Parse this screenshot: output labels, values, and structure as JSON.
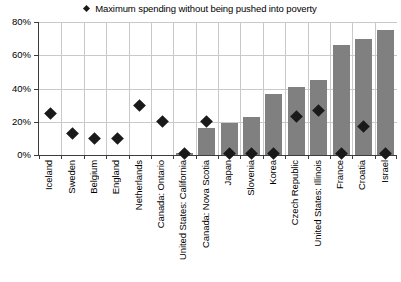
{
  "chart_data": {
    "type": "bar",
    "title": "",
    "xlabel": "",
    "ylabel": "",
    "ylim": [
      0,
      80
    ],
    "y_ticks": [
      "0%",
      "20%",
      "40%",
      "60%",
      "80%"
    ],
    "y_tick_values": [
      0,
      20,
      40,
      60,
      80
    ],
    "grid": true,
    "legend_position": "top-center",
    "legend": [
      {
        "name": "Maximum spending without being pushed into poverty",
        "marker": "diamond",
        "color": "#1a1a1a"
      }
    ],
    "categories": [
      "Iceland",
      "Sweden",
      "Belgium",
      "England",
      "Netherlands",
      "Canada: Ontario",
      "United States: California",
      "Canada: Nova Scotia",
      "Japan",
      "Slovenia",
      "Korea",
      "Czech Republic",
      "United States: Illinois",
      "France",
      "Croatia",
      "Israel"
    ],
    "series": [
      {
        "name": "Bar series",
        "type": "bar",
        "color": "#808080",
        "values": [
          0,
          0,
          0,
          0,
          0,
          0,
          1,
          16,
          19,
          23,
          37,
          41,
          45,
          66,
          70,
          75
        ]
      },
      {
        "name": "Maximum spending without being pushed into poverty",
        "type": "scatter",
        "marker": "diamond",
        "color": "#1a1a1a",
        "values": [
          25,
          13,
          10,
          10,
          30,
          20,
          1,
          20,
          1,
          1,
          1,
          23,
          27,
          1,
          17,
          1
        ]
      }
    ]
  }
}
